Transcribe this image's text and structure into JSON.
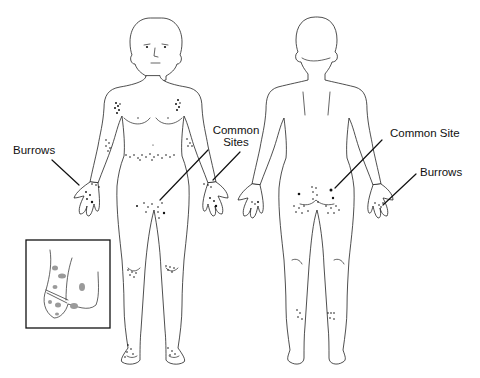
{
  "figure": {
    "colors": {
      "line": "#222222",
      "lesion_dot": "#111111",
      "inset_spot": "#9a9a9a",
      "background": "#ffffff"
    }
  },
  "labels": {
    "front_burrows": "Burrows",
    "front_common_sites_line1": "Common",
    "front_common_sites_line2": "Sites",
    "back_common_site": "Common Site",
    "back_burrows": "Burrows"
  },
  "views": [
    {
      "name": "anterior",
      "lesion_regions": [
        "axillary folds",
        "elbows",
        "waistline/belt",
        "wrists",
        "hands/finger webs",
        "genitals/groin",
        "knees",
        "feet"
      ]
    },
    {
      "name": "posterior",
      "lesion_regions": [
        "buttocks",
        "gluteal cleft",
        "hands",
        "ankles"
      ]
    }
  ],
  "inset": {
    "depiction": "male genitalia with grey papular lesions"
  }
}
